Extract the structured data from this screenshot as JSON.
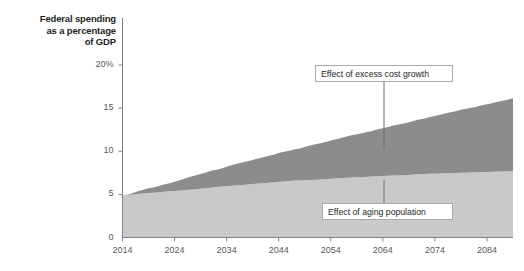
{
  "chart_data": {
    "type": "area",
    "title": "Federal spending as a percentage of GDP",
    "title_lines": [
      "Federal spending",
      "as a percentage",
      "of GDP"
    ],
    "xlabel": "",
    "ylabel": "Federal spending as a percentage of GDP",
    "xlim": [
      2014,
      2089
    ],
    "ylim": [
      0,
      20
    ],
    "grid": false,
    "legend_position": "none",
    "stacked": true,
    "yticks": [
      0,
      5,
      10,
      15,
      20
    ],
    "ytick_labels": [
      "0",
      "5",
      "10",
      "15",
      "20%"
    ],
    "xticks": [
      2014,
      2024,
      2034,
      2044,
      2054,
      2064,
      2074,
      2084
    ],
    "xtick_labels": [
      "2014",
      "2024",
      "2034",
      "2044",
      "2054",
      "2064",
      "2074",
      "2084"
    ],
    "colors": {
      "aging_population": "#c8c9ca",
      "excess_cost_growth": "#8b8c8e",
      "axis": "#808285",
      "callout_border": "#a7a9ac",
      "text": "#231f20",
      "tick_text": "#58595b"
    },
    "x": [
      2014,
      2015,
      2016,
      2017,
      2018,
      2019,
      2020,
      2021,
      2022,
      2023,
      2024,
      2025,
      2026,
      2027,
      2028,
      2029,
      2030,
      2031,
      2032,
      2033,
      2034,
      2035,
      2036,
      2037,
      2038,
      2039,
      2040,
      2041,
      2042,
      2043,
      2044,
      2045,
      2046,
      2047,
      2048,
      2049,
      2050,
      2051,
      2052,
      2053,
      2054,
      2055,
      2056,
      2057,
      2058,
      2059,
      2060,
      2061,
      2062,
      2063,
      2064,
      2065,
      2066,
      2067,
      2068,
      2069,
      2070,
      2071,
      2072,
      2073,
      2074,
      2075,
      2076,
      2077,
      2078,
      2079,
      2080,
      2081,
      2082,
      2083,
      2084,
      2085,
      2086,
      2087,
      2088,
      2089
    ],
    "series": [
      {
        "name": "Effect of aging population",
        "values": [
          4.9,
          4.95,
          5.0,
          5.05,
          5.1,
          5.15,
          5.2,
          5.25,
          5.3,
          5.35,
          5.4,
          5.45,
          5.5,
          5.55,
          5.6,
          5.65,
          5.7,
          5.78,
          5.85,
          5.9,
          5.95,
          6.0,
          6.05,
          6.1,
          6.15,
          6.2,
          6.25,
          6.3,
          6.35,
          6.4,
          6.45,
          6.5,
          6.55,
          6.6,
          6.62,
          6.65,
          6.68,
          6.7,
          6.73,
          6.76,
          6.8,
          6.84,
          6.88,
          6.92,
          6.95,
          6.98,
          7.0,
          7.03,
          7.06,
          7.09,
          7.12,
          7.15,
          7.18,
          7.2,
          7.23,
          7.26,
          7.29,
          7.32,
          7.35,
          7.38,
          7.4,
          7.42,
          7.44,
          7.46,
          7.48,
          7.5,
          7.52,
          7.54,
          7.56,
          7.58,
          7.6,
          7.62,
          7.64,
          7.66,
          7.68,
          7.7
        ]
      },
      {
        "name": "Effect of excess cost growth",
        "values": [
          0.0,
          0.05,
          0.15,
          0.3,
          0.45,
          0.55,
          0.6,
          0.72,
          0.85,
          0.95,
          1.05,
          1.2,
          1.35,
          1.5,
          1.6,
          1.7,
          1.85,
          1.95,
          2.0,
          2.1,
          2.25,
          2.4,
          2.5,
          2.6,
          2.7,
          2.8,
          2.9,
          3.0,
          3.1,
          3.2,
          3.35,
          3.45,
          3.5,
          3.6,
          3.7,
          3.85,
          4.0,
          4.1,
          4.2,
          4.3,
          4.45,
          4.55,
          4.65,
          4.78,
          4.9,
          5.0,
          5.1,
          5.2,
          5.3,
          5.45,
          5.55,
          5.65,
          5.8,
          5.9,
          6.0,
          6.1,
          6.25,
          6.35,
          6.45,
          6.6,
          6.7,
          6.8,
          6.95,
          7.05,
          7.15,
          7.3,
          7.4,
          7.5,
          7.6,
          7.75,
          7.85,
          7.95,
          8.1,
          8.2,
          8.3,
          8.45
        ]
      }
    ],
    "annotations": [
      {
        "label": "Effect of excess cost growth",
        "box_x": 315,
        "box_y": 65,
        "box_w": 138,
        "box_h": 17,
        "leader_x": 384,
        "leader_y1": 82,
        "leader_y2": 150
      },
      {
        "label": "Effect of aging population",
        "box_x": 322,
        "box_y": 203,
        "box_w": 131,
        "box_h": 17,
        "leader_x": 384,
        "leader_y1": 180,
        "leader_y2": 203
      }
    ]
  }
}
